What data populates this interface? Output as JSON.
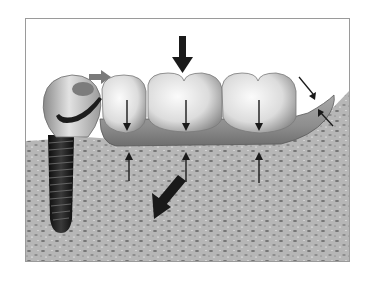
{
  "figure": {
    "type": "dental-illustration",
    "components": [
      {
        "name": "implant-fixture",
        "icon": "screw-implant"
      },
      {
        "name": "implant-crown",
        "icon": "crown-with-clasp"
      },
      {
        "name": "denture-teeth",
        "count": 3
      },
      {
        "name": "denture-base-saddle"
      },
      {
        "name": "alveolar-bone"
      }
    ],
    "arrows": {
      "occlusal_load": {
        "direction": "down",
        "weight": "heavy"
      },
      "mesial_push": {
        "direction": "right",
        "weight": "heavy",
        "color": "#7a7a7a"
      },
      "tooth_load": {
        "count": 3,
        "direction": "down",
        "weight": "thin"
      },
      "ridge_support": {
        "count": 3,
        "direction": "up",
        "weight": "thin"
      },
      "bone_resorption": {
        "direction": "down-left",
        "weight": "heavy"
      },
      "distal_flange": {
        "count": 2,
        "directions": [
          "down-right",
          "up-left"
        ],
        "weight": "thin"
      }
    },
    "colors": {
      "frame_border": "#9a9a9a",
      "bone": "#b4b4b4",
      "bone_speckle": "#6e6e6e",
      "tooth": "#e6e6e6",
      "saddle": "#8c8c8c",
      "implant": "#1e1e1e",
      "arrow": "#1a1a1a"
    }
  }
}
